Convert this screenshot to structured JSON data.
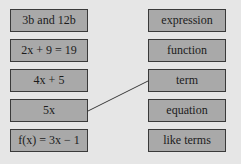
{
  "left_items": [
    {
      "label": "3b and 12b"
    },
    {
      "label": "2x + 9 = 19"
    },
    {
      "label": "4x + 5"
    },
    {
      "label": "5x"
    },
    {
      "label": "f(x) = 3x − 1"
    }
  ],
  "right_items": [
    {
      "label": "expression"
    },
    {
      "label": "function"
    },
    {
      "label": "term"
    },
    {
      "label": "equation"
    },
    {
      "label": "like terms"
    }
  ],
  "connections": [
    {
      "from": "5x",
      "to": "term"
    }
  ],
  "colors": {
    "background": "#e6e6e6",
    "box_fill": "#a9a9a9",
    "box_border": "#3a3a3a",
    "line": "#3a3a3a"
  }
}
